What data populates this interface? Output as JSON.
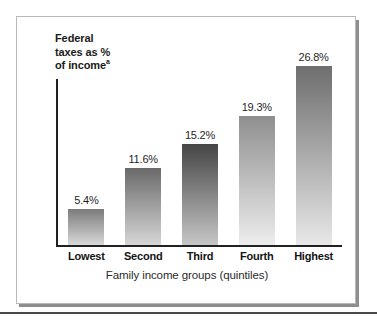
{
  "figure": {
    "y_axis_title_line1": "Federal",
    "y_axis_title_line2": "taxes as %",
    "y_axis_title_line3": "of income",
    "y_axis_title_superscript": "a",
    "x_axis_title": "Family income groups (quintiles)"
  },
  "chart_data": {
    "type": "bar",
    "title": "Federal taxes as % of income",
    "xlabel": "Family income groups (quintiles)",
    "ylabel": "Federal taxes as % of income",
    "categories": [
      "Lowest",
      "Second",
      "Third",
      "Fourth",
      "Highest"
    ],
    "values": [
      5.4,
      11.6,
      15.2,
      19.3,
      26.8
    ],
    "value_labels": [
      "5.4%",
      "11.6%",
      "15.2%",
      "19.3%",
      "26.8%"
    ],
    "ylim": [
      0,
      30
    ],
    "grid": false,
    "legend": "none",
    "bar_top_colors": [
      "#7b7b7b",
      "#6a6a6a",
      "#454545",
      "#8f8f8f",
      "#6e6e6e"
    ],
    "bar_bottom_colors": [
      "#d8d8d8",
      "#d6d6d6",
      "#c6c6c6",
      "#ededed",
      "#e8e8e8"
    ],
    "axis_color": "#212121",
    "background_color": "#ffffff"
  }
}
